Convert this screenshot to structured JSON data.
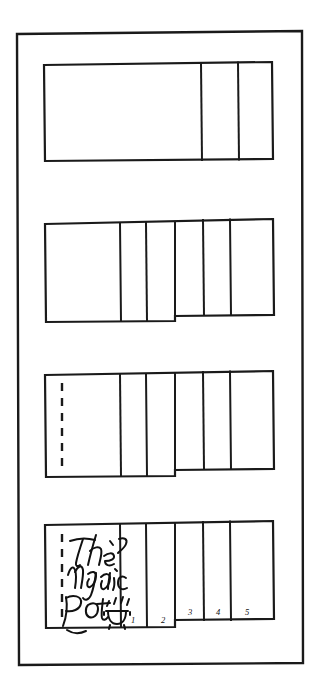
{
  "document": {
    "kind": "hand-drawn-sketch",
    "title": "The Magic Pot",
    "description": "Four-step hand-drawn diagram showing how a folded paper booklet is assembled",
    "ink_color": "#1a1a1a",
    "paper_color": "#ffffff",
    "frame_label": "outer border frame"
  },
  "handwriting": {
    "line1": "The",
    "line2": "Magic",
    "line3": "Pot",
    "full_title": "The Magic Pot",
    "pot_icon": "cooking-pot-icon",
    "steam_icon": "steam-marks-icon"
  },
  "page_numbers": {
    "values": [
      "1",
      "2",
      "3",
      "4",
      "5"
    ],
    "n1": "1",
    "n2": "2",
    "n3": "3",
    "n4": "4",
    "n5": "5"
  },
  "steps": [
    {
      "id": "step-1",
      "name": "flat-sheet",
      "label": "Step 1 — flat sheet with two right-hand panels",
      "divider_count": 2,
      "has_dashed_fold": false,
      "has_title": false,
      "has_page_numbers": false,
      "stepped": false
    },
    {
      "id": "step-2",
      "name": "folded-stepped",
      "label": "Step 2 — left block folded down creating a step",
      "divider_count": 4,
      "has_dashed_fold": false,
      "has_title": false,
      "has_page_numbers": false,
      "stepped": true
    },
    {
      "id": "step-3",
      "name": "folded-with-fold-line",
      "label": "Step 3 — same stepped fold with dashed fold line on left edge",
      "divider_count": 4,
      "has_dashed_fold": true,
      "has_title": false,
      "has_page_numbers": false,
      "stepped": true
    },
    {
      "id": "step-4",
      "name": "finished-booklet",
      "label": "Step 4 — finished booklet with cover title and numbered pages",
      "divider_count": 4,
      "has_dashed_fold": true,
      "has_title": true,
      "has_page_numbers": true,
      "stepped": true
    }
  ]
}
